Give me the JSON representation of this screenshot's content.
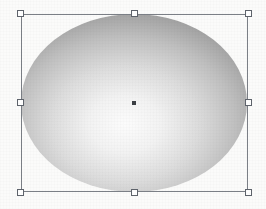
{
  "app": {
    "surface": "vector-drawing-canvas",
    "background_color": "#fbfbfa",
    "width": 266,
    "height": 209
  },
  "selection": {
    "state_label": "selected",
    "bounds": {
      "x": 21,
      "y": 14,
      "width": 227,
      "height": 178
    },
    "outline_color": "#7b7f86",
    "handle_fill": "#ffffff",
    "handle_border": "#5e636b",
    "handle_size": 7,
    "handles": [
      {
        "id": "nw",
        "position_label": "top-left",
        "x": 21,
        "y": 14
      },
      {
        "id": "n",
        "position_label": "top-center",
        "x": 134,
        "y": 14
      },
      {
        "id": "ne",
        "position_label": "top-right",
        "x": 248,
        "y": 14
      },
      {
        "id": "w",
        "position_label": "middle-left",
        "x": 21,
        "y": 103
      },
      {
        "id": "e",
        "position_label": "middle-right",
        "x": 248,
        "y": 103
      },
      {
        "id": "sw",
        "position_label": "bottom-left",
        "x": 21,
        "y": 192
      },
      {
        "id": "s",
        "position_label": "bottom-center",
        "x": 134,
        "y": 192
      },
      {
        "id": "se",
        "position_label": "bottom-right",
        "x": 248,
        "y": 192
      }
    ],
    "center_marker": {
      "x": 134,
      "y": 103,
      "color": "#3c3f44",
      "size": 4
    }
  },
  "shape": {
    "type": "ellipse",
    "label": "Ellipse",
    "cx": 134,
    "cy": 103,
    "rx": 113,
    "ry": 89,
    "stroke": "none",
    "fill_type": "radial-gradient",
    "gradient": {
      "focus_x_pct": 46,
      "focus_y_pct": 62,
      "stops": [
        {
          "offset": 0.0,
          "color": "#fcfcfc"
        },
        {
          "offset": 0.22,
          "color": "#f2f2f2"
        },
        {
          "offset": 0.45,
          "color": "#dcdcdc"
        },
        {
          "offset": 0.68,
          "color": "#bfbfbf"
        },
        {
          "offset": 0.86,
          "color": "#a3a3a3"
        },
        {
          "offset": 1.0,
          "color": "#8d8d8d"
        }
      ]
    }
  }
}
